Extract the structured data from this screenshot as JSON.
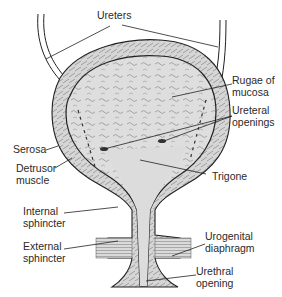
{
  "diagram": {
    "labels": [
      {
        "id": "ureters",
        "line1": "Ureters",
        "line2": ""
      },
      {
        "id": "rugae",
        "line1": "Rugae of",
        "line2": "mucosa"
      },
      {
        "id": "ureteral-openings",
        "line1": "Ureteral",
        "line2": "openings"
      },
      {
        "id": "serosa",
        "line1": "Serosa",
        "line2": ""
      },
      {
        "id": "detrusor",
        "line1": "Detrusor",
        "line2": "muscle"
      },
      {
        "id": "trigone",
        "line1": "Trigone",
        "line2": ""
      },
      {
        "id": "internal-sphincter",
        "line1": "Internal",
        "line2": "sphincter"
      },
      {
        "id": "external-sphincter",
        "line1": "External",
        "line2": "sphincter"
      },
      {
        "id": "urogenital-diaphragm",
        "line1": "Urogenital",
        "line2": "diaphragm"
      },
      {
        "id": "urethral-opening",
        "line1": "Urethral",
        "line2": "opening"
      }
    ],
    "colors": {
      "line": "#222222",
      "wall_fill": "#cfcfcf",
      "lumen_fill": "#dcdcdc",
      "text": "#2a2a2a",
      "background": "#ffffff"
    }
  }
}
